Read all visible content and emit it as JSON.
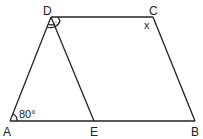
{
  "diagram": {
    "type": "trapezoid",
    "points": {
      "A": {
        "label": "A",
        "x": 10,
        "y": 121
      },
      "E": {
        "label": "E",
        "x": 94,
        "y": 121
      },
      "B": {
        "label": "B",
        "x": 195,
        "y": 121
      },
      "C": {
        "label": "C",
        "x": 153,
        "y": 17
      },
      "D": {
        "label": "D",
        "x": 51,
        "y": 17
      }
    },
    "segments": [
      "AB",
      "BC",
      "CD",
      "DA",
      "DE"
    ],
    "angle_labels": {
      "A": "80°",
      "C": "x"
    },
    "marks": {
      "D": "angle bisector arcs (angle ADC bisected by DE)"
    },
    "colors": {
      "stroke": "#222222",
      "background": "#ffffff"
    }
  }
}
